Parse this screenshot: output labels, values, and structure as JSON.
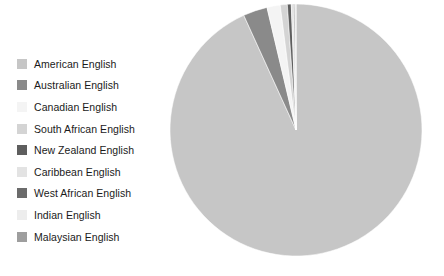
{
  "chart_data": {
    "type": "pie",
    "title": "",
    "legend_position": "left",
    "grid": false,
    "unit": "percent",
    "start_angle_deg": 0,
    "direction": "clockwise",
    "categories": [
      "American English",
      "Australian English",
      "Canadian English",
      "South African English",
      "New Zealand English",
      "Caribbean English",
      "West African English",
      "Indian English",
      "Malaysian English"
    ],
    "values": [
      93.2,
      3.1,
      1.7,
      0.9,
      0.5,
      0.3,
      0.15,
      0.1,
      0.05
    ],
    "colors": [
      "#c6c6c6",
      "#8a8a8a",
      "#f4f4f4",
      "#d4d4d4",
      "#5e5e5e",
      "#e3e3e3",
      "#6b6b6b",
      "#ededed",
      "#9e9e9e"
    ],
    "slices": [
      {
        "label": "American English",
        "value": 93.2,
        "color": "#c6c6c6"
      },
      {
        "label": "Australian English",
        "value": 3.1,
        "color": "#8a8a8a"
      },
      {
        "label": "Canadian English",
        "value": 1.7,
        "color": "#f4f4f4"
      },
      {
        "label": "South African English",
        "value": 0.9,
        "color": "#d4d4d4"
      },
      {
        "label": "New Zealand English",
        "value": 0.5,
        "color": "#5e5e5e"
      },
      {
        "label": "Caribbean English",
        "value": 0.3,
        "color": "#e3e3e3"
      },
      {
        "label": "West African English",
        "value": 0.15,
        "color": "#6b6b6b"
      },
      {
        "label": "Indian English",
        "value": 0.1,
        "color": "#ededed"
      },
      {
        "label": "Malaysian English",
        "value": 0.05,
        "color": "#9e9e9e"
      }
    ]
  },
  "legend": {
    "items": [
      {
        "label": "American English",
        "color": "#c6c6c6"
      },
      {
        "label": "Australian English",
        "color": "#8a8a8a"
      },
      {
        "label": "Canadian English",
        "color": "#f4f4f4"
      },
      {
        "label": "South African English",
        "color": "#d4d4d4"
      },
      {
        "label": "New Zealand English",
        "color": "#5e5e5e"
      },
      {
        "label": "Caribbean English",
        "color": "#e3e3e3"
      },
      {
        "label": "West African English",
        "color": "#6b6b6b"
      },
      {
        "label": "Indian English",
        "color": "#ededed"
      },
      {
        "label": "Malaysian English",
        "color": "#9e9e9e"
      }
    ]
  },
  "pie_geometry": {
    "center_x": 127,
    "center_y": 127,
    "radius": 126
  }
}
